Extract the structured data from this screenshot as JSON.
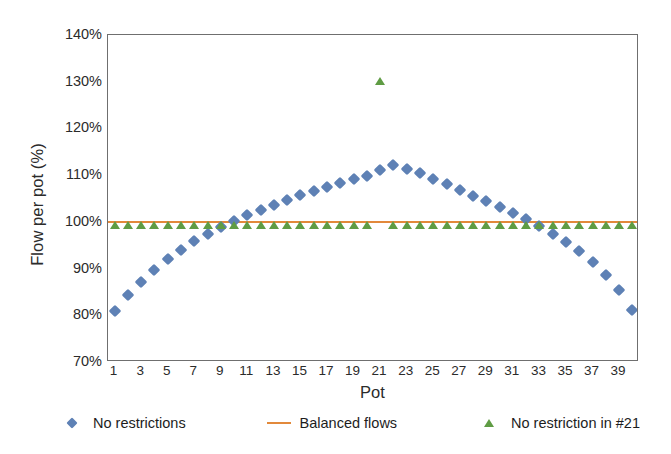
{
  "chart_data": {
    "type": "scatter",
    "title": "",
    "xlabel": "Pot",
    "ylabel": "Flow per pot (%)",
    "xlim": [
      0.5,
      40.5
    ],
    "ylim": [
      70,
      140
    ],
    "yticks": [
      "140%",
      "130%",
      "120%",
      "110%",
      "100%",
      "90%",
      "80%",
      "70%"
    ],
    "ytick_values": [
      140,
      130,
      120,
      110,
      100,
      90,
      80,
      70
    ],
    "xticks": [
      "1",
      "3",
      "5",
      "7",
      "9",
      "11",
      "13",
      "15",
      "17",
      "19",
      "21",
      "23",
      "25",
      "27",
      "29",
      "31",
      "33",
      "35",
      "37",
      "39"
    ],
    "xtick_values": [
      1,
      3,
      5,
      7,
      9,
      11,
      13,
      15,
      17,
      19,
      21,
      23,
      25,
      27,
      29,
      31,
      33,
      35,
      37,
      39
    ],
    "x": [
      1,
      2,
      3,
      4,
      5,
      6,
      7,
      8,
      9,
      10,
      11,
      12,
      13,
      14,
      15,
      16,
      17,
      18,
      19,
      20,
      21,
      22,
      23,
      24,
      25,
      26,
      27,
      28,
      29,
      30,
      31,
      32,
      33,
      34,
      35,
      36,
      37,
      38,
      39,
      40
    ],
    "grid": false,
    "legend_position": "bottom",
    "series": [
      {
        "name": "No restrictions",
        "marker": "diamond",
        "color": "#5e81b5",
        "values": [
          81.0,
          84.4,
          87.2,
          89.8,
          92.0,
          94.0,
          95.8,
          97.4,
          98.8,
          100.2,
          101.4,
          102.6,
          103.7,
          104.7,
          105.7,
          106.6,
          107.5,
          108.3,
          109.1,
          109.8,
          111.2,
          112.1,
          111.4,
          110.4,
          109.2,
          108.0,
          106.8,
          105.6,
          104.4,
          103.2,
          102.0,
          100.6,
          99.1,
          97.5,
          95.7,
          93.7,
          91.4,
          88.7,
          85.4,
          81.2
        ]
      },
      {
        "name": "Balanced flows",
        "marker": "line",
        "color": "#e2893b",
        "values": [
          100,
          100,
          100,
          100,
          100,
          100,
          100,
          100,
          100,
          100,
          100,
          100,
          100,
          100,
          100,
          100,
          100,
          100,
          100,
          100,
          100,
          100,
          100,
          100,
          100,
          100,
          100,
          100,
          100,
          100,
          100,
          100,
          100,
          100,
          100,
          100,
          100,
          100,
          100,
          100
        ]
      },
      {
        "name": "No restriction in #21",
        "marker": "triangle",
        "color": "#5f9c44",
        "values": [
          99.2,
          99.2,
          99.2,
          99.2,
          99.2,
          99.2,
          99.2,
          99.2,
          99.2,
          99.2,
          99.2,
          99.2,
          99.2,
          99.2,
          99.2,
          99.2,
          99.2,
          99.2,
          99.2,
          99.2,
          130.0,
          99.2,
          99.2,
          99.2,
          99.2,
          99.2,
          99.2,
          99.2,
          99.2,
          99.2,
          99.2,
          99.2,
          99.2,
          99.2,
          99.2,
          99.2,
          99.2,
          99.2,
          99.2,
          99.2
        ]
      }
    ]
  },
  "legend": [
    {
      "label": "No restrictions",
      "marker": "diamond-marker-icon"
    },
    {
      "label": "Balanced flows",
      "marker": "line-marker-icon"
    },
    {
      "label": "No restriction in #21",
      "marker": "triangle-marker-icon"
    }
  ]
}
